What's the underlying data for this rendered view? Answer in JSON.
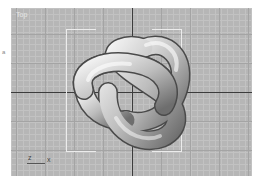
{
  "viewport": {
    "label": "Top",
    "background_color": "#b6b6b6",
    "axis_gizmo": {
      "vertical_axis": "z",
      "horizontal_axis": "x"
    },
    "object": "torus-knot"
  },
  "side_mark": "a"
}
